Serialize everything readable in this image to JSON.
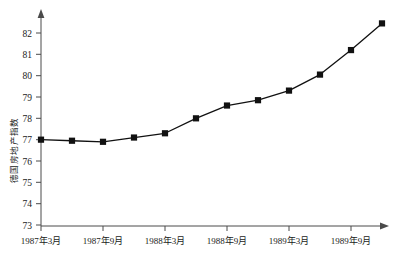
{
  "chart_data": {
    "type": "line",
    "title": "",
    "xlabel": "",
    "ylabel": "德国房地产指数",
    "ylim": [
      73,
      82.9
    ],
    "yticks": [
      73,
      74,
      75,
      76,
      77,
      78,
      79,
      80,
      81,
      82
    ],
    "ytick_labels": [
      "73",
      "74",
      "75",
      "76",
      "77",
      "78",
      "79",
      "80",
      "81",
      "82"
    ],
    "grid": false,
    "legend": "none",
    "x": [
      "1987年3月",
      "1987年6月",
      "1987年9月",
      "1987年12月",
      "1988年3月",
      "1988年6月",
      "1988年9月",
      "1988年12月",
      "1989年3月",
      "1989年6月",
      "1989年9月",
      "1989年12月"
    ],
    "xtick_labels": [
      "1987年3月",
      "1987年9月",
      "1988年3月",
      "1988年9月",
      "1989年3月",
      "1989年9月"
    ],
    "values": [
      77.0,
      76.95,
      76.9,
      77.1,
      77.3,
      78.0,
      78.6,
      78.85,
      79.3,
      80.05,
      81.2,
      82.45
    ],
    "series": [
      {
        "name": "德国房地产指数",
        "marker": "square",
        "color": "#111111",
        "values": [
          77.0,
          76.95,
          76.9,
          77.1,
          77.3,
          78.0,
          78.6,
          78.85,
          79.3,
          80.05,
          81.2,
          82.45
        ]
      }
    ]
  },
  "axes": {
    "y_axis_name": "y-axis",
    "x_axis_name": "x-axis"
  }
}
